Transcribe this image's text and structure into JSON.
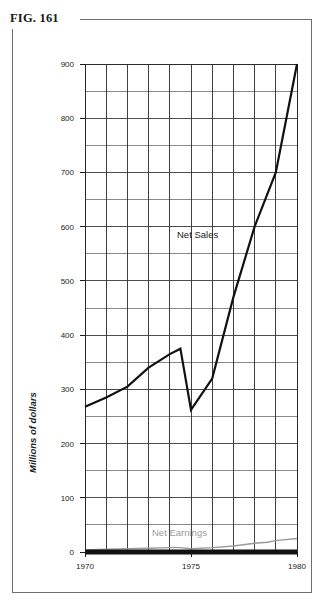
{
  "figure": {
    "label": "FIG. 161"
  },
  "chart_data": {
    "type": "line",
    "title": "FIG. 161",
    "xlabel": "",
    "ylabel": "Millions of dollars",
    "xlim": [
      1970,
      1980
    ],
    "ylim": [
      0,
      900
    ],
    "grid": true,
    "y_major_step": 100,
    "y_minor_step": 50,
    "x_major_step": 5,
    "x_minor_step": 1,
    "legend_position": "inline-annotation",
    "x": [
      1970,
      1971,
      1972,
      1973,
      1974,
      1974.5,
      1975,
      1976,
      1977,
      1978,
      1978.6,
      1979,
      1980
    ],
    "series": [
      {
        "name": "Net Sales",
        "color": "#111111",
        "values": [
          268,
          285,
          305,
          340,
          365,
          375,
          262,
          320,
          470,
          600,
          660,
          700,
          900
        ]
      },
      {
        "name": "Net Earnings",
        "color": "#9a9a9a",
        "values": [
          4,
          5,
          6,
          7,
          8,
          8,
          6,
          8,
          11,
          16,
          18,
          21,
          25
        ]
      }
    ],
    "y_tick_labels": [
      "0",
      "100",
      "200",
      "300",
      "400",
      "500",
      "600",
      "700",
      "800",
      "900"
    ],
    "y_tick_values": [
      0,
      100,
      200,
      300,
      400,
      500,
      600,
      700,
      800,
      900
    ],
    "x_tick_labels": [
      "1970",
      "1975",
      "1980"
    ],
    "x_tick_values": [
      1970,
      1975,
      1980
    ],
    "annotations": [
      {
        "text": "Net Sales",
        "x": 1975.3,
        "y": 545
      },
      {
        "text": "Net Earnings",
        "x": 1974.2,
        "y": 48
      }
    ]
  }
}
